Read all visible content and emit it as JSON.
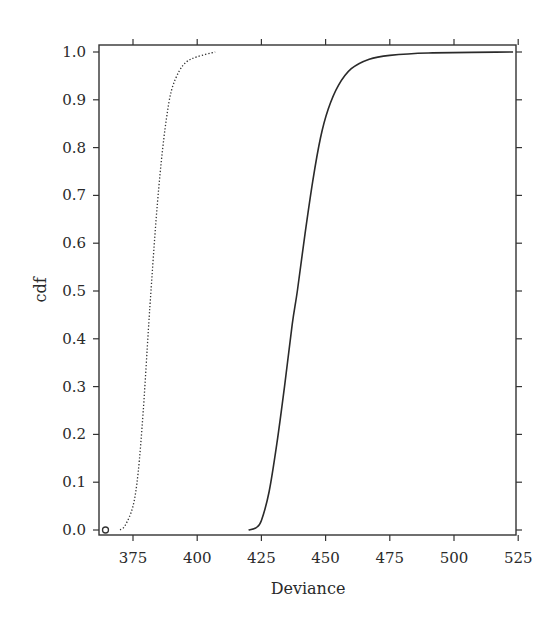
{
  "chart_data": {
    "type": "line",
    "title": "",
    "xlabel": "Deviance",
    "ylabel": "cdf",
    "xlim": [
      362.5,
      524
    ],
    "ylim": [
      0.0,
      1.0
    ],
    "grid": false,
    "legend": null,
    "x_ticks": [
      375,
      400,
      425,
      450,
      475,
      500,
      525
    ],
    "x_tick_labels": [
      "375",
      "400",
      "425",
      "450",
      "475",
      "500",
      "525"
    ],
    "y_ticks": [
      0.0,
      0.1,
      0.2,
      0.3,
      0.4,
      0.5,
      0.6,
      0.7,
      0.8,
      0.9,
      1.0
    ],
    "y_tick_labels": [
      "0.0",
      "0.1",
      "0.2",
      "0.3",
      "0.4",
      "0.5",
      "0.6",
      "0.7",
      "0.8",
      "0.9",
      "1.0"
    ],
    "series": [
      {
        "name": "dotted cdf",
        "style": "dotted",
        "color": "#333333",
        "x": [
          370,
          372,
          375,
          377,
          379,
          381,
          382,
          384,
          386,
          388,
          390,
          393,
          396,
          400,
          407
        ],
        "y": [
          0.0,
          0.01,
          0.05,
          0.12,
          0.25,
          0.42,
          0.5,
          0.65,
          0.77,
          0.86,
          0.92,
          0.96,
          0.98,
          0.99,
          1.0
        ]
      },
      {
        "name": "solid cdf",
        "style": "solid",
        "color": "#2a2a2a",
        "x": [
          420,
          423,
          425,
          428,
          431,
          434,
          437,
          439,
          442,
          445,
          448,
          451,
          455,
          460,
          467,
          475,
          490,
          523
        ],
        "y": [
          0.0,
          0.005,
          0.02,
          0.08,
          0.18,
          0.3,
          0.43,
          0.5,
          0.62,
          0.73,
          0.82,
          0.88,
          0.93,
          0.965,
          0.985,
          0.993,
          0.998,
          1.0
        ]
      }
    ],
    "annotations": [
      {
        "type": "point-marker",
        "shape": "open-circle",
        "x": 363.5,
        "y": 0.0
      }
    ]
  }
}
